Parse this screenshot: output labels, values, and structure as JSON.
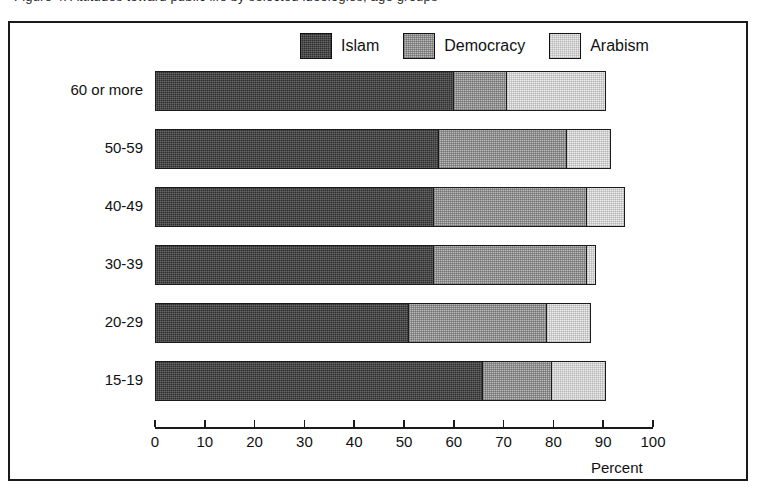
{
  "caption": {
    "text": "Figure 4. Attitudes toward public life by selected ideologies, age groups"
  },
  "legend": {
    "position": "top-center",
    "items": [
      {
        "label": "Islam",
        "key": "islam",
        "color": "#2e2e2e"
      },
      {
        "label": "Democracy",
        "key": "democracy",
        "color": "#b9b9b9"
      },
      {
        "label": "Arabism",
        "key": "arabism",
        "color": "#ededed"
      }
    ]
  },
  "axis": {
    "x_title": "Percent",
    "ticks": [
      0,
      10,
      20,
      30,
      40,
      50,
      60,
      70,
      80,
      90,
      100
    ]
  },
  "chart_data": {
    "type": "bar",
    "orientation": "horizontal",
    "stacked": true,
    "title": "",
    "xlabel": "Percent",
    "ylabel": "",
    "xlim": [
      0,
      100
    ],
    "grid": false,
    "legend_position": "top-center",
    "categories": [
      "60 or more",
      "50-59",
      "40-49",
      "30-39",
      "20-29",
      "15-19"
    ],
    "tick_labels": [
      "0",
      "10",
      "20",
      "30",
      "40",
      "50",
      "60",
      "70",
      "80",
      "90",
      "100"
    ],
    "series": [
      {
        "name": "Islam",
        "color": "#2e2e2e",
        "values": [
          60,
          57,
          56,
          56,
          51,
          66
        ]
      },
      {
        "name": "Democracy",
        "color": "#b9b9b9",
        "values": [
          11,
          26,
          31,
          31,
          28,
          14
        ]
      },
      {
        "name": "Arabism",
        "color": "#ededed",
        "values": [
          20,
          9,
          8,
          2,
          9,
          11
        ]
      }
    ],
    "cumulative_ends": {
      "islam": [
        60,
        57,
        56,
        56,
        51,
        66
      ],
      "democracy": [
        71,
        83,
        87,
        87,
        79,
        80
      ],
      "arabism": [
        91,
        92,
        95,
        89,
        88,
        91
      ]
    },
    "totals": [
      91,
      92,
      95,
      89,
      88,
      91
    ]
  }
}
